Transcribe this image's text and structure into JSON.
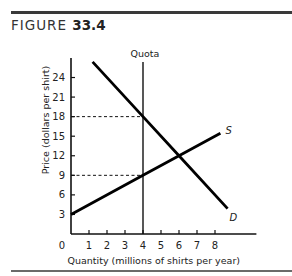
{
  "figure": {
    "label": "FIGURE",
    "number": "33.4"
  },
  "chart_data": {
    "type": "line",
    "title": "FIGURE 33.4",
    "xlabel": "Quantity (millions of shirts per year)",
    "ylabel": "Price (dollars per shirt)",
    "xlim": [
      0,
      9.5
    ],
    "ylim": [
      0,
      27
    ],
    "x_ticks": [
      1,
      2,
      3,
      4,
      5,
      6,
      7,
      8
    ],
    "x_tick_labels": [
      "0",
      "1",
      "2",
      "3",
      "4",
      "5",
      "6",
      "7",
      "8"
    ],
    "y_ticks": [
      3,
      6,
      9,
      12,
      15,
      18,
      21,
      24
    ],
    "y_tick_labels": [
      "3",
      "6",
      "9",
      "12",
      "15",
      "18",
      "21",
      "24"
    ],
    "grid": false,
    "series": [
      {
        "name": "D",
        "label": "D",
        "points": [
          [
            1.2,
            26.4
          ],
          [
            4,
            18
          ],
          [
            6,
            12
          ],
          [
            8.7,
            3.9
          ]
        ]
      },
      {
        "name": "S",
        "label": "S",
        "points": [
          [
            0,
            3
          ],
          [
            4,
            9
          ],
          [
            6,
            12
          ],
          [
            8.3,
            15.45
          ]
        ]
      }
    ],
    "annotations": [
      {
        "type": "vline",
        "x": 4,
        "label": "Quota"
      },
      {
        "type": "hline_dashed",
        "y": 18,
        "x_to": 4
      },
      {
        "type": "hline_dashed",
        "y": 9,
        "x_to": 4
      }
    ],
    "equilibrium": {
      "quantity": 6,
      "price": 12
    },
    "quota_outcome": {
      "quantity": 4,
      "demand_price": 18,
      "supply_price": 9
    }
  }
}
